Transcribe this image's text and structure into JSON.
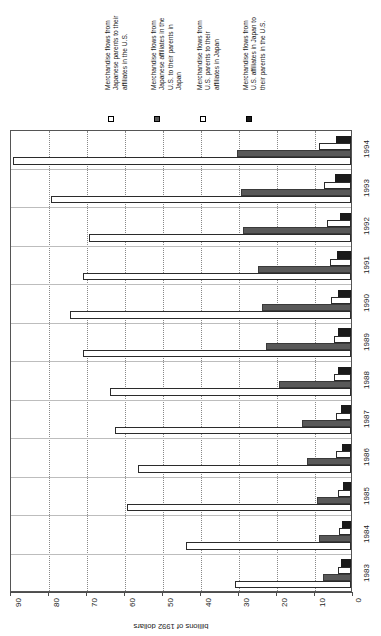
{
  "chart_data": {
    "type": "bar",
    "orientation": "horizontal",
    "title": "",
    "xlabel": "billions of 1992 dollars",
    "ylabel": "",
    "xlim": [
      0,
      90
    ],
    "xticks": [
      "90",
      "80",
      "70",
      "60",
      "50",
      "40",
      "30",
      "20",
      "10",
      "0"
    ],
    "xtick_values": [
      90,
      80,
      70,
      60,
      50,
      40,
      30,
      20,
      10,
      0
    ],
    "axis_direction": "reversed",
    "grid": "dotted vertical gridlines",
    "legend_position": "top",
    "categories": [
      "1994",
      "1993",
      "1992",
      "1991",
      "1990",
      "1989",
      "1988",
      "1987",
      "1986",
      "1985",
      "1984",
      "1983"
    ],
    "series": [
      {
        "name": "Merchandise flows from U.S. affiliates in Japan to their parents in the U.S.",
        "marker": "black-square",
        "color": "#1a1a1a",
        "values": [
          4.0,
          4.2,
          3.0,
          3.6,
          3.5,
          3.3,
          3.4,
          2.7,
          2.5,
          2.2,
          2.3,
          2.6
        ]
      },
      {
        "name": "Merchandise flows from U.S. parents to their affiliates in Japan",
        "marker": "white-square",
        "color": "#ffffff",
        "values": [
          8.5,
          7.0,
          6.3,
          5.6,
          5.2,
          4.4,
          4.4,
          3.9,
          3.9,
          3.4,
          3.2,
          3.3
        ]
      },
      {
        "name": "Merchandise flows from Japanese affiliates in the U.S. to their parents in Japan",
        "marker": "gray-square",
        "color": "#595959",
        "values": [
          30.0,
          29.0,
          28.5,
          24.5,
          23.5,
          22.5,
          19.0,
          13.0,
          11.5,
          9.0,
          8.5,
          7.5
        ]
      },
      {
        "name": "Merchandise flows from Japanese parents to their affiliates in the U.S.",
        "marker": "white-square",
        "color": "#ffffff",
        "values": [
          89.0,
          79.0,
          69.0,
          70.5,
          74.0,
          70.5,
          63.5,
          62.0,
          56.0,
          59.0,
          43.5,
          30.5
        ]
      }
    ]
  },
  "legend": {
    "entries": [
      {
        "label": "Merchandise flows from\nJapanese parents to their\naffiliates in the U.S.",
        "marker": "white-square"
      },
      {
        "label": "Merchandise flows from\nJapanese affiliates in the\nU.S. to their parents in\nJapan",
        "marker": "gray-square"
      },
      {
        "label": "Merchandise flows from\nU.S. parents to their\naffiliates in Japan",
        "marker": "white-square"
      },
      {
        "label": "Merchandise flows from\nU.S. affiliates in Japan to\ntheir parents in the U.S.",
        "marker": "black-square"
      }
    ]
  },
  "axis": {
    "value_title": "billions of 1992 dollars"
  },
  "colors": {
    "series_black": "#1a1a1a",
    "series_gray": "#595959",
    "series_white": "#ffffff",
    "grid": "#888888",
    "frame": "#555555"
  }
}
